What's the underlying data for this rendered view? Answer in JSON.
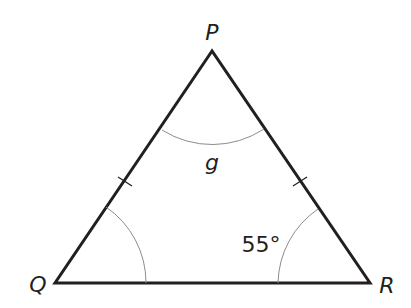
{
  "figure": {
    "type": "isosceles-triangle",
    "vertices": {
      "P": {
        "label": "P",
        "x": 212,
        "y": 51
      },
      "Q": {
        "label": "Q",
        "x": 55,
        "y": 283
      },
      "R": {
        "label": "R",
        "x": 370,
        "y": 283
      }
    },
    "angles": {
      "P": {
        "label": "g"
      },
      "Q": {
        "label": ""
      },
      "R": {
        "label": "55°"
      }
    },
    "equal_sides": [
      "PQ",
      "PR"
    ],
    "colors": {
      "line": "#231f20",
      "arc": "#8c8c8c",
      "text": "#231f20"
    }
  }
}
